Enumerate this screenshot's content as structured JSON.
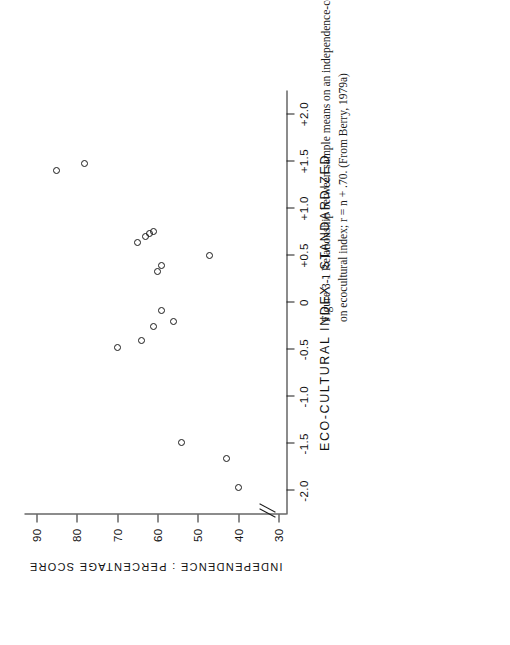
{
  "figure": {
    "caption_line1": "Figure 3-1  Relationship between sample means on an independence-conformity task and sample position",
    "caption_line2": "on ecocultural index; r = n + .70. (From Berry, 1979a)",
    "caption_full": "Figure 3-1  Relationship between sample means on an independence-conformity task and sample position on ecocultural index; r = n + .70. (From Berry, 1979a)",
    "page_background": "#ffffff",
    "ink_color": "#1a1a1a",
    "rotation_note": "plot and caption are printed rotated 90 degrees counter-clockwise"
  },
  "chart_data": {
    "type": "scatter",
    "title": "",
    "xlabel": "ECO-CULTURAL INDEX  :  STANDARDIZED",
    "ylabel": "INDEPENDENCE  :  PERCENTAGE SCORE",
    "xlim": [
      -2.25,
      2.25
    ],
    "ylim": [
      28,
      93
    ],
    "xticks": [
      -2.0,
      -1.5,
      -1.0,
      -0.5,
      0,
      0.5,
      1.0,
      1.5,
      2.0
    ],
    "xticklabels": [
      "-2.0",
      "-1.5",
      "-1.0",
      "-0.5",
      "0",
      "+0.5",
      "+1.0",
      "+1.5",
      "+2.0"
    ],
    "yticks": [
      30,
      40,
      50,
      60,
      70,
      80,
      90
    ],
    "yticklabels": [
      "30",
      "40",
      "50",
      "60",
      "70",
      "80",
      "90"
    ],
    "y_axis_break": true,
    "y_axis_break_after": 30,
    "grid": false,
    "legend": false,
    "marker": "open-circle",
    "points": [
      {
        "x": -1.96,
        "y": 40
      },
      {
        "x": -1.66,
        "y": 43
      },
      {
        "x": -1.49,
        "y": 54
      },
      {
        "x": -0.48,
        "y": 70
      },
      {
        "x": -0.4,
        "y": 64
      },
      {
        "x": -0.26,
        "y": 61
      },
      {
        "x": -0.2,
        "y": 56
      },
      {
        "x": -0.08,
        "y": 59
      },
      {
        "x": 0.33,
        "y": 60
      },
      {
        "x": 0.39,
        "y": 59
      },
      {
        "x": 0.5,
        "y": 47
      },
      {
        "x": 0.64,
        "y": 65
      },
      {
        "x": 0.7,
        "y": 63
      },
      {
        "x": 0.73,
        "y": 62
      },
      {
        "x": 0.75,
        "y": 61
      },
      {
        "x": 1.4,
        "y": 85
      },
      {
        "x": 1.47,
        "y": 78
      }
    ]
  }
}
